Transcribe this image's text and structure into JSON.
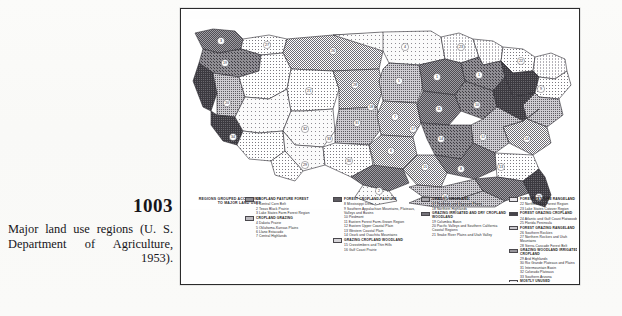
{
  "caption": {
    "figure_number": "1003",
    "text": "Major land use regions (U. S. Department of Agriculture, 1953)."
  },
  "map": {
    "title": "MAJOR LAND USE REGIONS",
    "intro_header": "REGIONS GROUPED ACCORDING TO MAJOR LAND USES"
  },
  "legend": {
    "groups": [
      {
        "header": "CROPLAND PASTURE FOREST",
        "swatch": "p1",
        "items": [
          "1 Central Corn Belt",
          "2 Texas Black Prairie",
          "3 Lake States Farm Forest Region"
        ]
      },
      {
        "header": "CROPLAND GRAZING",
        "swatch": "p2",
        "items": [
          "4 Dakota Prairie",
          "5 Oklahoma-Kansas Plains",
          "6 Llano Estacado",
          "7 Central Highlands"
        ]
      },
      {
        "header": "FOREST CROPLAND PASTURE",
        "swatch": "p3",
        "items": [
          "8 Mississippi Delta",
          "9 Southern Appalachian Mountains, Plateaus, Valleys and Basins",
          "10 Piedmont",
          "11 Eastern Forest Farm-Grown Region",
          "12 Eastern Upper Coastal Plain",
          "13 Western Coastal Plain",
          "14 Ozark and Ouachita Mountains"
        ]
      },
      {
        "header": "GRAZING CROPLAND WOODLAND",
        "swatch": "p4",
        "items": [
          "15 Crosstimbers and Thin Hills",
          "16 Gulf Coast Prairie"
        ]
      },
      {
        "header": "GRAZING CROPLAND",
        "swatch": "p5",
        "items": [
          "17 Redbeds and Gypsum Plains",
          "18 Northern Highlands"
        ]
      },
      {
        "header": "GRAZING IRRIGATED AND DRY CROPLAND WOODLAND",
        "swatch": "p6",
        "items": [
          "19 Columbia Basin",
          "20 Pacific Valleys and Southern California Coastal Regions",
          "21 Snake River Plains and Utah Valley"
        ]
      },
      {
        "header": "FOREST PASTURE RANGELAND",
        "swatch": "p7",
        "items": [
          "22 Northeastern Forest Region",
          "23 Lake States Cutover Region"
        ]
      },
      {
        "header": "FOREST GRAZING CROPLAND",
        "swatch": "p8",
        "items": [
          "24 Atlantic and Gulf Coast Flatwoods",
          "25 Florida Peninsula"
        ]
      },
      {
        "header": "FOREST GRAZING RANGELAND",
        "swatch": "p9",
        "items": [
          "26 Southern Rockies",
          "27 Northern Rockies and Utah Mountains",
          "28 Sierra-Cascade Forest Belt"
        ]
      },
      {
        "header": "GRAZING WOODLAND IRRIGATED CROPLAND",
        "swatch": "p10",
        "items": [
          "29 Arid Highlands",
          "30 Rio Grande Plateaus and Plains",
          "31 Intermountain Basin",
          "32 Colorado Plateaus",
          "33 Southern Arizona"
        ]
      },
      {
        "header": "MOSTLY UNUSED",
        "swatch": "p7",
        "items": [
          "34 Desert"
        ]
      }
    ]
  }
}
